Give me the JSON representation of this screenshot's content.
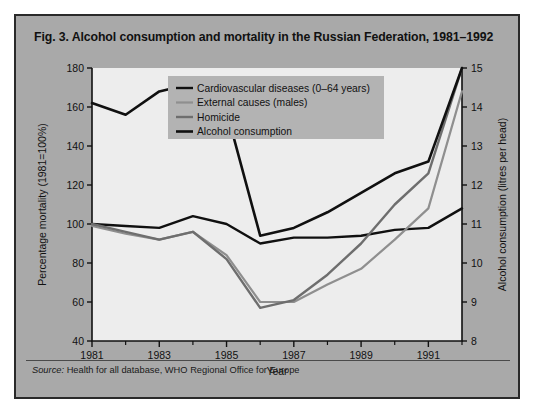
{
  "figure": {
    "title": "Fig. 3. Alcohol consumption and mortality in the Russian Federation, 1981–1992",
    "source_label": "Source:",
    "source_text": " Health for all database, WHO Regional Office for Europe",
    "panel_color": "#a9a9a9",
    "plot_color": "#ededed",
    "legend_color": "#b3b3b3"
  },
  "chart_data": {
    "type": "line",
    "title": "Fig. 3. Alcohol consumption and mortality in the Russian Federation, 1981–1992",
    "xlabel": "Year",
    "ylabel": "Percentage mortality (1981=100%)",
    "y2label": "Alcohol consumption (litres per head)",
    "x": [
      1981,
      1982,
      1983,
      1984,
      1985,
      1986,
      1987,
      1988,
      1989,
      1990,
      1991,
      1992
    ],
    "xlim": [
      1981,
      1992
    ],
    "xticks": [
      1981,
      1983,
      1985,
      1987,
      1989,
      1991
    ],
    "xtick_labels": [
      "1981",
      "1983",
      "1985",
      "1987",
      "1989",
      "1991"
    ],
    "xminor": [
      1982,
      1984,
      1986,
      1988,
      1990,
      1992
    ],
    "ylim": [
      40,
      180
    ],
    "yticks": [
      40,
      60,
      80,
      100,
      120,
      140,
      160,
      180
    ],
    "ytick_labels": [
      "40",
      "60",
      "80",
      "100",
      "120",
      "140",
      "160",
      "180"
    ],
    "y2lim": [
      8,
      15
    ],
    "y2ticks": [
      8,
      9,
      10,
      11,
      12,
      13,
      14,
      15
    ],
    "y2tick_labels": [
      "8",
      "9",
      "10",
      "11",
      "12",
      "13",
      "14",
      "15"
    ],
    "grid": false,
    "legend_position": "upper center",
    "series": [
      {
        "name": "Cardiovascular diseases (0–64 years)",
        "axis": "left",
        "color": "#101010",
        "width": 2.4,
        "values": [
          100,
          99,
          98,
          104,
          100,
          90,
          93,
          93,
          94,
          97,
          98,
          108
        ]
      },
      {
        "name": "External causes (males)",
        "axis": "left",
        "color": "#8f8f8f",
        "width": 2.2,
        "values": [
          99,
          95,
          92,
          96,
          84,
          60,
          60,
          69,
          77,
          92,
          108,
          168
        ]
      },
      {
        "name": "Homicide",
        "axis": "left",
        "color": "#6e6e6e",
        "width": 2.4,
        "values": [
          100,
          96,
          92,
          96,
          82,
          57,
          61,
          74,
          90,
          110,
          126,
          180
        ]
      },
      {
        "name": "Alcohol consumption",
        "axis": "right",
        "color": "#101010",
        "width": 2.6,
        "values": [
          14.1,
          13.8,
          14.4,
          14.6,
          13.9,
          10.7,
          10.9,
          11.3,
          11.8,
          12.3,
          12.6,
          15.0
        ]
      }
    ]
  }
}
